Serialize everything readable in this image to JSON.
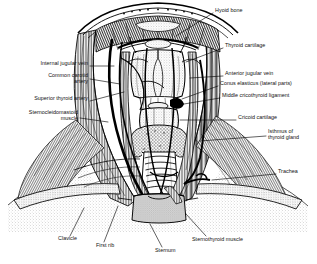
{
  "figure": {
    "background_color": "#ffffff",
    "ink_color": "#000000",
    "label_text_color": "#111111"
  },
  "labels": [
    {
      "id": "hyoid-bone",
      "text": "Hyoid bone",
      "side": "right",
      "x": 215,
      "y": 10,
      "align": "l"
    },
    {
      "id": "thyroid-cartilage",
      "text": "Thyroid cartilage",
      "side": "right",
      "x": 225,
      "y": 45,
      "align": "l"
    },
    {
      "id": "anterior-jugular-vein",
      "text": "Anterior jugular vein",
      "side": "right",
      "x": 225,
      "y": 73,
      "align": "l"
    },
    {
      "id": "conus-elasticus",
      "text": "Conus elasticus (lateral parts)",
      "side": "right",
      "x": 220,
      "y": 83,
      "align": "l"
    },
    {
      "id": "middle-cricothyroid-ligament",
      "text": "Middle cricothyroid ligament",
      "side": "right",
      "x": 222,
      "y": 95,
      "align": "l"
    },
    {
      "id": "cricoid-cartilage",
      "text": "Cricoid cartilage",
      "side": "right",
      "x": 238,
      "y": 117,
      "align": "l"
    },
    {
      "id": "isthmus-of-thyroid-gland",
      "text": "Isthmus of\nthyroid gland",
      "side": "right",
      "x": 268,
      "y": 131,
      "align": "l"
    },
    {
      "id": "trachea",
      "text": "Trachea",
      "side": "right",
      "x": 278,
      "y": 171,
      "align": "l"
    },
    {
      "id": "internal-jugular-vein",
      "text": "Internal jugular vein",
      "side": "left",
      "x": 88,
      "y": 63,
      "align": "r"
    },
    {
      "id": "common-carotid-artery",
      "text": "Common carotid\nartery",
      "side": "left",
      "x": 88,
      "y": 75,
      "align": "r"
    },
    {
      "id": "superior-thyroid-artery",
      "text": "Superior thyroid artery",
      "side": "left",
      "x": 88,
      "y": 98,
      "align": "r"
    },
    {
      "id": "sternocleidomastoid-muscle",
      "text": "Sternocleidomastoid\nmuscle",
      "side": "left",
      "x": 78,
      "y": 112,
      "align": "r"
    },
    {
      "id": "clavicle",
      "text": "Clavicle",
      "side": "bottom",
      "x": 58,
      "y": 238,
      "align": "l"
    },
    {
      "id": "first-rib",
      "text": "First rib",
      "side": "bottom",
      "x": 96,
      "y": 245,
      "align": "l"
    },
    {
      "id": "sternum",
      "text": "Sternum",
      "side": "bottom",
      "x": 155,
      "y": 250,
      "align": "l"
    },
    {
      "id": "sternothyroid-muscle",
      "text": "Sternothyroid muscle",
      "side": "bottom",
      "x": 192,
      "y": 239,
      "align": "l"
    }
  ],
  "structures": [
    "mandible-arch",
    "hyoid-bone",
    "thyroid-cartilage",
    "cricoid-cartilage",
    "cricothyroid-ligament",
    "thyroid-gland-isthmus",
    "trachea-rings",
    "sternocleidomastoid-left",
    "sternocleidomastoid-right",
    "infrahyoid-strap-muscles",
    "internal-jugular-vein",
    "common-carotid-artery",
    "anterior-jugular-vein",
    "clavicle-left",
    "clavicle-right",
    "first-rib",
    "sternum",
    "pectoral-region"
  ]
}
